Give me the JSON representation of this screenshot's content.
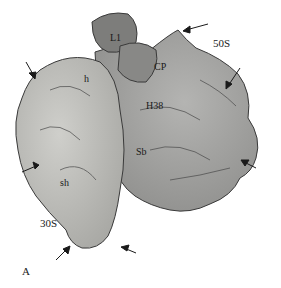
{
  "figure": {
    "panel_label": "A",
    "subunits": {
      "large": "50S",
      "small": "30S"
    },
    "features": {
      "L1": "L1",
      "CP": "CP",
      "h": "h",
      "H38": "H38",
      "Sb": "Sb",
      "sh": "sh"
    },
    "colors": {
      "background": "#ffffff",
      "small_subunit": "#b8b8b4",
      "large_subunit": "#9a9a98",
      "L1_stalk": "#7d7d7b",
      "outline": "#3a3a3a",
      "arrow": "#1a1a1a"
    },
    "arrows_count": 7
  }
}
